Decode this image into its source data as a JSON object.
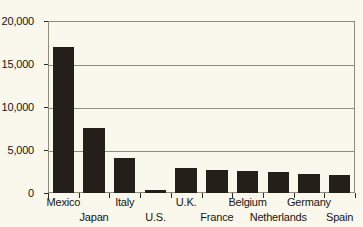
{
  "chart_data": {
    "type": "bar",
    "title": "",
    "subtitle": "",
    "xlabel": "",
    "ylabel": "",
    "categories": [
      "Mexico",
      "Japan",
      "Italy",
      "U.S.",
      "U.K.",
      "France",
      "Belgium",
      "Netherlands",
      "Germany",
      "Spain"
    ],
    "values": [
      17000,
      7550,
      4050,
      300,
      2900,
      2650,
      2550,
      2450,
      2250,
      2050
    ],
    "series": [
      {
        "name": "",
        "values": [
          17000,
          7550,
          4050,
          300,
          2900,
          2650,
          2550,
          2450,
          2250,
          2050
        ]
      }
    ],
    "ylim": [
      0,
      20000
    ],
    "yticks": [
      0,
      5000,
      10000,
      15000,
      20000
    ],
    "ytick_labels": [
      "0",
      "5,000",
      "10,000",
      "15,000",
      "20,000"
    ],
    "grid": true,
    "grid_axis": "y",
    "legend": "none",
    "label_rows": [
      0,
      1,
      0,
      1,
      0,
      1,
      0,
      1,
      0,
      1
    ],
    "bar_color": "#241f18",
    "background_color": "#faf8ed",
    "axis_color": "#8d8d7e",
    "text_color": "#141414"
  }
}
